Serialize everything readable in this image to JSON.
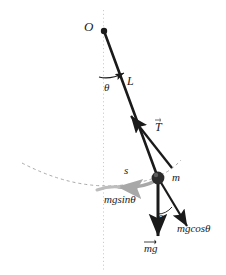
{
  "figure": {
    "background_color": "#ffffff",
    "ink_color": "#1a1a1a",
    "accent_gray": "#a8a8a8",
    "dotted_guide_color": "#c9c9c9"
  },
  "labels": {
    "pivot": "O",
    "angle_rod": "θ",
    "rod_length": "L",
    "tension": "T",
    "mass": "m",
    "arc_length": "s",
    "tangential_force": "mgsinθ",
    "angle_force": "θ",
    "radial_force": "mgcosθ",
    "weight": "mg"
  },
  "elements": {
    "vertical_reference": "vertical-dotted-line",
    "rod": "pendulum-rod",
    "bob": "pendulum-bob",
    "trajectory": "dashed-trajectory-arc",
    "arc_displacement": "gray-arc-arrow",
    "tension_vector": "tension-arrow",
    "weight_vector": "weight-arrow",
    "radial_vector": "mgcos-arrow",
    "angle_arc_rod": "angle-arc-at-pivot",
    "angle_arc_force": "angle-arc-at-bob"
  },
  "geometry": {
    "pivot": [
      104,
      31
    ],
    "bob": [
      158,
      178
    ],
    "mg_tip": [
      158,
      236
    ],
    "mgcos_tip": [
      186,
      224
    ],
    "mgsin_tip": [
      122,
      186
    ],
    "tension_tip": [
      131,
      116
    ],
    "rod_angle_deg": 20
  }
}
